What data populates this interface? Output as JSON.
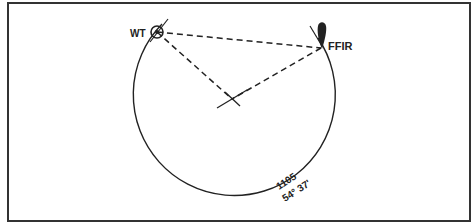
{
  "diagram": {
    "labels": {
      "wt": "WT",
      "ffir": "FFIR",
      "arc_value": "1105",
      "arc_angle": "54° 37'"
    },
    "colors": {
      "ink": "#222222",
      "border": "#333333",
      "background": "#ffffff"
    },
    "points": {
      "wt": [
        157,
        32
      ],
      "ffir": [
        321,
        48
      ],
      "center": [
        232,
        99
      ]
    },
    "circle": {
      "cx": 232,
      "cy": 103,
      "r": 100
    }
  }
}
